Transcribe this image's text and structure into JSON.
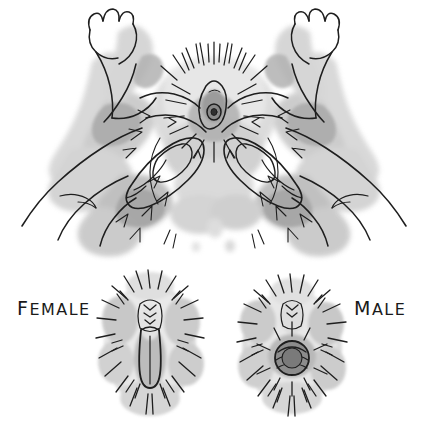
{
  "illustration": {
    "medium": "ink line drawing with grey watercolour wash",
    "background_color": "#ffffff",
    "ink_color": "#1a1a1a",
    "wash_light": "#dcdcdc",
    "wash_mid": "#b4b4b4",
    "wash_dark": "#8c8c8c"
  },
  "panels": {
    "top": {
      "name": "hands-sexing-animal",
      "description": "Two human hands holding a small furred animal on its back, thumbs pressed either side of the genital area, hind paws splayed upward"
    },
    "bottom_left": {
      "name": "female-genital-closeup",
      "label": "FEMALE",
      "label_first_letter": "F",
      "label_rest": "EMALE",
      "opening_shape": "slit"
    },
    "bottom_right": {
      "name": "male-genital-closeup",
      "label": "MALE",
      "label_first_letter": "M",
      "label_rest": "ALE",
      "opening_shape": "round"
    }
  }
}
